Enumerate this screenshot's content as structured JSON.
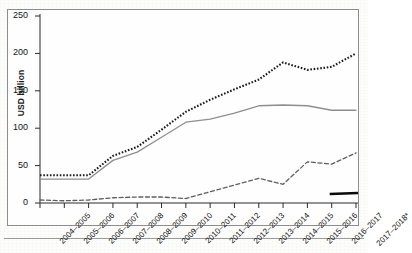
{
  "figure": {
    "y_axis_title": "USD billion",
    "footnote_marker": "*"
  },
  "chart_data": {
    "type": "line",
    "title": "",
    "subtitle": "",
    "xlabel": "",
    "ylabel": "USD billion",
    "ylim": [
      0,
      250
    ],
    "yticks": [
      0,
      50,
      100,
      150,
      200,
      250
    ],
    "ytick_labels": [
      "0",
      "50",
      "100",
      "150",
      "200",
      "250"
    ],
    "grid": false,
    "legend": "none",
    "categories": [
      "2004–2005",
      "2005–2006",
      "2006–2007",
      "2007–2008",
      "2008–2009",
      "2009–2010",
      "2010–2011",
      "2011–2012",
      "2012–2013",
      "2013–2014",
      "2014–2015",
      "2015–2016",
      "2016–2017",
      "2017–2018*"
    ],
    "series": [
      {
        "name": "dotted-series",
        "style": "dotted",
        "color": "#1a1a1a",
        "values": [
          37,
          37,
          37,
          63,
          75,
          98,
          122,
          138,
          152,
          165,
          188,
          178,
          182,
          200
        ]
      },
      {
        "name": "solid-series",
        "style": "solid",
        "color": "#8e8e8e",
        "values": [
          32,
          32,
          32,
          57,
          68,
          88,
          108,
          112,
          120,
          130,
          131,
          130,
          124,
          124
        ]
      },
      {
        "name": "dashed-series",
        "style": "dashed",
        "color": "#5e5e5e",
        "values": [
          4,
          3,
          4,
          7,
          8,
          8,
          6,
          15,
          24,
          33,
          25,
          55,
          52,
          67
        ]
      }
    ],
    "annotations": [
      {
        "name": "black-bar-marker",
        "type": "bar",
        "x_start": 12,
        "x_end": 13,
        "value": 12
      }
    ]
  }
}
